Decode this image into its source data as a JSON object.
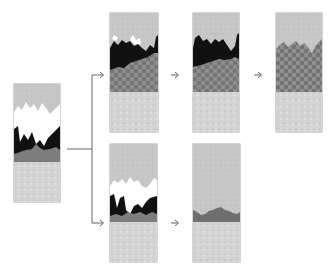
{
  "diagram": {
    "title": "",
    "colors": {
      "top_layer": "#c6c6c6",
      "white_layer": "#ffffff",
      "black_layer": "#111111",
      "dark_band": "#7c7c7c",
      "checker_dark": "#7a7a7a",
      "checker_light": "#8e8e8e",
      "base_layer": "#d5d5d5",
      "line": "#666666"
    },
    "panels": [
      {
        "id": "initial",
        "label": "",
        "x": 14,
        "y": 84,
        "w": 46,
        "h": 118
      },
      {
        "id": "top-1",
        "label": "",
        "x": 110,
        "y": 13,
        "w": 48,
        "h": 119
      },
      {
        "id": "top-2",
        "label": "",
        "x": 193,
        "y": 13,
        "w": 46,
        "h": 119
      },
      {
        "id": "top-3",
        "label": "",
        "x": 276,
        "y": 13,
        "w": 46,
        "h": 119
      },
      {
        "id": "bottom-1",
        "label": "",
        "x": 110,
        "y": 144,
        "w": 47,
        "h": 118
      },
      {
        "id": "bottom-2",
        "label": "",
        "x": 193,
        "y": 144,
        "w": 47,
        "h": 118
      }
    ],
    "arrows": [
      {
        "from": "initial",
        "to": "top-1"
      },
      {
        "from": "initial",
        "to": "bottom-1"
      },
      {
        "from": "top-1",
        "to": "top-2"
      },
      {
        "from": "top-2",
        "to": "top-3"
      },
      {
        "from": "bottom-1",
        "to": "bottom-2"
      }
    ]
  }
}
